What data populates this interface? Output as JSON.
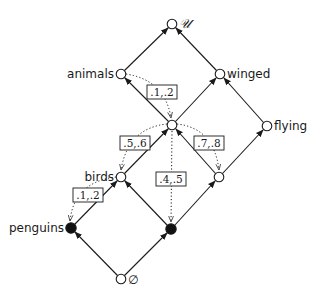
{
  "diagram": {
    "type": "lattice",
    "nodes": [
      {
        "id": "top",
        "label": "𝒰",
        "x": 172,
        "y": 24,
        "filled": false,
        "label_side": "right"
      },
      {
        "id": "animals",
        "label": "animals",
        "x": 121,
        "y": 74,
        "filled": false,
        "label_side": "left"
      },
      {
        "id": "winged",
        "label": "winged",
        "x": 220,
        "y": 74,
        "filled": false,
        "label_side": "right"
      },
      {
        "id": "center",
        "label": "",
        "x": 172,
        "y": 125,
        "filled": false,
        "label_side": "none"
      },
      {
        "id": "flying",
        "label": "flying",
        "x": 267,
        "y": 126,
        "filled": false,
        "label_side": "right"
      },
      {
        "id": "birds",
        "label": "birds",
        "x": 121,
        "y": 177,
        "filled": false,
        "label_side": "left"
      },
      {
        "id": "right",
        "label": "",
        "x": 219,
        "y": 177,
        "filled": false,
        "label_side": "none"
      },
      {
        "id": "penguins",
        "label": "penguins",
        "x": 71,
        "y": 228,
        "filled": true,
        "label_side": "left"
      },
      {
        "id": "black",
        "label": "",
        "x": 171,
        "y": 229,
        "filled": true,
        "label_side": "none"
      },
      {
        "id": "bottom",
        "label": "∅",
        "x": 121,
        "y": 279,
        "filled": false,
        "label_side": "right"
      }
    ],
    "edges": [
      {
        "from": "animals",
        "to": "top"
      },
      {
        "from": "winged",
        "to": "top"
      },
      {
        "from": "center",
        "to": "animals"
      },
      {
        "from": "center",
        "to": "winged"
      },
      {
        "from": "flying",
        "to": "winged"
      },
      {
        "from": "birds",
        "to": "center"
      },
      {
        "from": "right",
        "to": "center"
      },
      {
        "from": "right",
        "to": "flying"
      },
      {
        "from": "penguins",
        "to": "birds"
      },
      {
        "from": "black",
        "to": "birds"
      },
      {
        "from": "black",
        "to": "right"
      },
      {
        "from": "bottom",
        "to": "penguins"
      },
      {
        "from": "bottom",
        "to": "black"
      }
    ],
    "dotted_arrows": [
      {
        "from": "animals",
        "to": "center",
        "label": ".1,.2",
        "label_x": 162,
        "label_y": 92
      },
      {
        "from": "center",
        "to": "birds",
        "label": ".5,.6",
        "label_x": 135,
        "label_y": 143
      },
      {
        "from": "center",
        "to": "right",
        "label": ".7,.8",
        "label_x": 209,
        "label_y": 143
      },
      {
        "from": "center",
        "to": "black",
        "label": ".4,.5",
        "label_x": 171,
        "label_y": 179
      },
      {
        "from": "birds",
        "to": "penguins",
        "label": ".1,.2",
        "label_x": 88,
        "label_y": 195
      }
    ]
  },
  "labels": {
    "top": "𝒰",
    "animals": "animals",
    "winged": "winged",
    "flying": "flying",
    "birds": "birds",
    "penguins": "penguins",
    "bottom": "∅",
    "edge_animals_center": ".1,.2",
    "edge_center_birds": ".5,.6",
    "edge_center_right": ".7,.8",
    "edge_center_black": ".4,.5",
    "edge_birds_penguins": ".1,.2"
  }
}
